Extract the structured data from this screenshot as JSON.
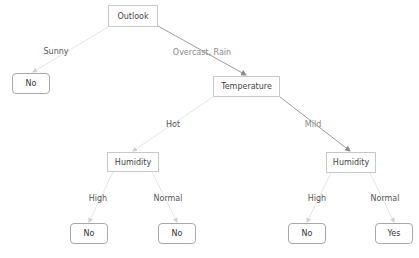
{
  "colors": {
    "edge_path": "#9a9a9a",
    "edge_other": "#e4e4e4",
    "node_border": "#c8c8c8",
    "leaf_border": "#a8a8a8"
  },
  "nodes": {
    "outlook": "Outlook",
    "temperature": "Temperature",
    "humidity_left": "Humidity",
    "humidity_right": "Humidity",
    "leaf_sunny": "No",
    "leaf_hot_high": "No",
    "leaf_hot_normal": "No",
    "leaf_mild_high": "No",
    "leaf_mild_normal": "Yes"
  },
  "edges": {
    "sunny": "Sunny",
    "overcast_rain": "Overcast, Rain",
    "hot": "Hot",
    "mild": "Mild",
    "high_left": "High",
    "normal_left": "Normal",
    "high_right": "High",
    "normal_right": "Normal"
  }
}
